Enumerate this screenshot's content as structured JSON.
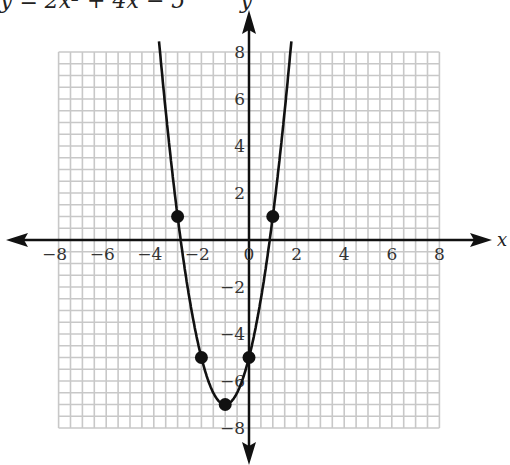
{
  "chart_data": {
    "type": "line",
    "title": "y = 2x² + 4x − 5",
    "xlabel": "x",
    "ylabel": "y",
    "xlim": [
      -8,
      8
    ],
    "ylim": [
      -8,
      8
    ],
    "grid": true,
    "x_ticks": [
      -8,
      -6,
      -4,
      -2,
      0,
      2,
      4,
      6,
      8
    ],
    "y_ticks": [
      -8,
      -6,
      -4,
      -2,
      2,
      4,
      6,
      8
    ],
    "series": [
      {
        "name": "y = 2x² + 4x − 5",
        "function": "2x^2+4x-5",
        "points": [
          [
            -3,
            1
          ],
          [
            -2,
            -5
          ],
          [
            -1,
            -7
          ],
          [
            0,
            -5
          ],
          [
            1,
            1
          ]
        ]
      }
    ]
  },
  "labels": {
    "title": "y = 2x² + 4x − 5",
    "y_axis": "y",
    "x_axis": "x"
  }
}
